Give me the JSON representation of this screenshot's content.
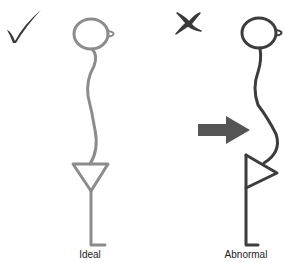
{
  "diagram": {
    "panels": [
      {
        "id": "ideal",
        "label": "Ideal",
        "marker": "check-mark-icon",
        "stroke_color": "#8c8c8c",
        "marker_color": "#3a3a3a"
      },
      {
        "id": "abnormal",
        "label": "Abnormal",
        "marker": "x-mark-icon",
        "stroke_color": "#3d3d3d",
        "marker_color": "#3a3a3a",
        "arrow": "right-arrow-icon",
        "arrow_color": "#555555"
      }
    ]
  }
}
